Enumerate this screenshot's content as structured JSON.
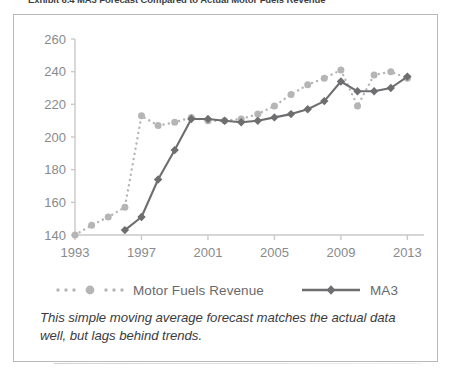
{
  "exhibit": {
    "title": "Exhibit 6.4    MA3 Forecast Compared to Actual Motor Fuels Revenue",
    "caption": "This simple moving average forecast matches the actual data well, but lags behind trends."
  },
  "legend": {
    "position": "bottom-center",
    "entries": [
      {
        "label": "Motor Fuels Revenue",
        "style": "dotted",
        "color": "#b5b5b5",
        "marker": "circle"
      },
      {
        "label": "MA3",
        "style": "solid",
        "color": "#6e6e70",
        "marker": "diamond"
      }
    ]
  },
  "colors": {
    "actual": "#b5b5b5",
    "forecast": "#6e6e70",
    "axis": "#c9c9c9",
    "tick_label": "#8a8a8c",
    "card_border": "#b9b9b9",
    "caption_text": "#3c3c3e",
    "title_text": "#3f3f41"
  },
  "chart_data": {
    "type": "line",
    "title": "MA3 Forecast Compared to Actual Motor Fuels Revenue",
    "xlabel": "",
    "ylabel": "",
    "xlim": [
      1993,
      2014
    ],
    "ylim": [
      140,
      260
    ],
    "yticks": [
      140,
      160,
      180,
      200,
      220,
      240,
      260
    ],
    "xticks": [
      1993,
      1997,
      2001,
      2005,
      2009,
      2013
    ],
    "grid": false,
    "x": [
      1993,
      1994,
      1995,
      1996,
      1997,
      1998,
      1999,
      2000,
      2001,
      2002,
      2003,
      2004,
      2005,
      2006,
      2007,
      2008,
      2009,
      2010,
      2011,
      2012,
      2013
    ],
    "series": [
      {
        "name": "Motor Fuels Revenue",
        "style": "dotted",
        "color": "#b5b5b5",
        "marker": "circle",
        "values": [
          140,
          146,
          151,
          157,
          213,
          207,
          209,
          212,
          210,
          210,
          211,
          214,
          219,
          226,
          232,
          236,
          241,
          219,
          238,
          240,
          236
        ]
      },
      {
        "name": "MA3",
        "style": "solid",
        "color": "#6e6e70",
        "marker": "diamond",
        "values": [
          null,
          null,
          null,
          143,
          151,
          174,
          192,
          211,
          211,
          210,
          209,
          210,
          212,
          214,
          217,
          222,
          234,
          228,
          228,
          230,
          237
        ]
      }
    ]
  }
}
